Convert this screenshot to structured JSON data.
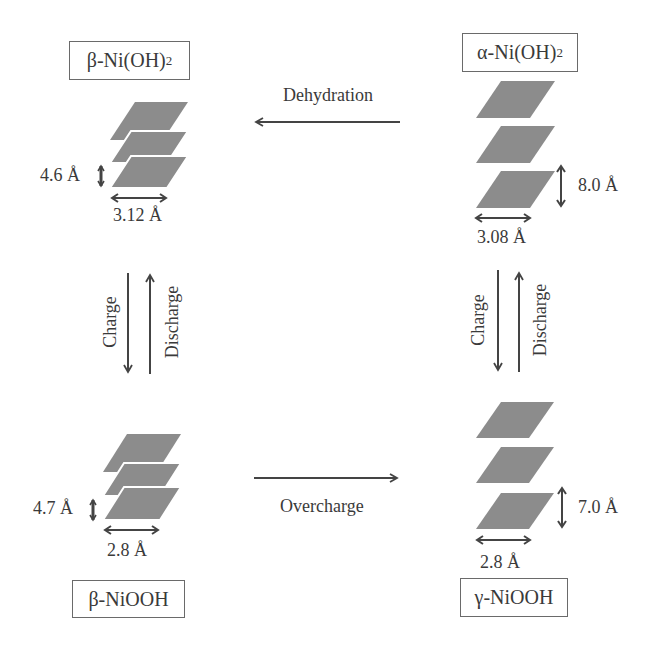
{
  "diagram": {
    "type": "phase-transformation-diagram",
    "colors": {
      "layer_fill": "#8c8c8c",
      "arrow": "#444444",
      "text": "#3a3a3a",
      "box_border": "#6a6a6a"
    },
    "phases": {
      "beta_nioh2": {
        "prefix": "β-Ni(OH)",
        "subscript": "2",
        "interlayer_spacing": "4.6 Å",
        "in_plane_spacing": "3.12 Å"
      },
      "alpha_nioh2": {
        "prefix": "α-Ni(OH)",
        "subscript": "2",
        "interlayer_spacing": "8.0 Å",
        "in_plane_spacing": "3.08 Å"
      },
      "beta_niooh": {
        "prefix": "β-NiOOH",
        "subscript": "",
        "interlayer_spacing": "4.7 Å",
        "in_plane_spacing": "2.8 Å"
      },
      "gamma_niooh": {
        "prefix": "γ-NiOOH",
        "subscript": "",
        "interlayer_spacing": "7.0 Å",
        "in_plane_spacing": "2.8 Å"
      }
    },
    "transitions": {
      "dehydration": "Dehydration",
      "overcharge": "Overcharge",
      "left_charge": "Charge",
      "left_discharge": "Discharge",
      "right_charge": "Charge",
      "right_discharge": "Discharge"
    }
  }
}
